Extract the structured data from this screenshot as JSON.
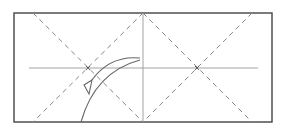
{
  "diagram": {
    "type": "origami-fold-diagram",
    "width": 286,
    "height": 131,
    "colors": {
      "background": "#ffffff",
      "paper_edge": "#444444",
      "crease_line": "#999999",
      "dashed_valley": "#888888",
      "arrow": "#666666"
    },
    "paper": {
      "x": 14,
      "y": 13,
      "width": 258,
      "height": 109
    },
    "center_vertical_crease": {
      "x": 143,
      "y1": 13,
      "y2": 122
    },
    "horizontal_crease": {
      "y": 68,
      "x1": 29,
      "x2": 258
    },
    "dashed_diagonals": [
      {
        "x1": 33,
        "y1": 13,
        "x2": 143,
        "y2": 122
      },
      {
        "x1": 143,
        "y1": 13,
        "x2": 33,
        "y2": 122
      },
      {
        "x1": 143,
        "y1": 13,
        "x2": 252,
        "y2": 122
      },
      {
        "x1": 252,
        "y1": 13,
        "x2": 143,
        "y2": 122
      }
    ],
    "markers": [
      {
        "x": 88,
        "y": 68,
        "symbol": "x"
      },
      {
        "x": 197,
        "y": 68,
        "symbol": "x"
      }
    ],
    "fold_arrow": {
      "direction": "from right-center to left-lower",
      "label": ""
    },
    "fold_arc": {
      "from": "bottom near x=80",
      "to": "top-right of arc near x=140"
    }
  }
}
